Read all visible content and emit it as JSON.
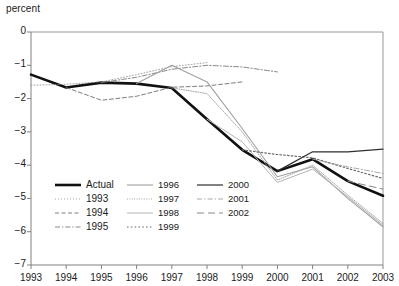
{
  "chart_data": {
    "type": "line",
    "title": "",
    "ylabel": "percent",
    "xlabel": "",
    "ylim": [
      -7,
      0
    ],
    "xlim": [
      1993,
      2003
    ],
    "grid": false,
    "legend_position": "inside-lower-left",
    "x": [
      1993,
      1994,
      1995,
      1996,
      1997,
      1998,
      1999,
      2000,
      2001,
      2002,
      2003
    ],
    "yticks": [
      "0",
      "−1",
      "−2",
      "−3",
      "−4",
      "−5",
      "−6",
      "−7"
    ],
    "ytick_values": [
      0,
      -1,
      -2,
      -3,
      -4,
      -5,
      -6,
      -7
    ],
    "xticks": [
      "1993",
      "1994",
      "1995",
      "1996",
      "1997",
      "1998",
      "1999",
      "2000",
      "2001",
      "2002",
      "2003"
    ],
    "series": [
      {
        "name": "Actual",
        "style": "solid",
        "width": 2.6,
        "color": "#111111",
        "x": [
          1993,
          1994,
          1995,
          1996,
          1997,
          1998,
          1999,
          2000,
          2001,
          2002,
          2003
        ],
        "values": [
          -1.28,
          -1.67,
          -1.52,
          -1.55,
          -1.68,
          -2.62,
          -3.54,
          -4.18,
          -3.82,
          -4.48,
          -4.92
        ]
      },
      {
        "name": "1993",
        "style": "fine-dotted",
        "width": 0.8,
        "color": "#8c8c8c",
        "x": [
          1993,
          1994,
          1995,
          1996,
          1997,
          1998
        ],
        "values": [
          -1.6,
          -1.57,
          -1.5,
          -1.28,
          -1.04,
          -0.92
        ]
      },
      {
        "name": "1994",
        "style": "dashed",
        "width": 0.9,
        "color": "#6e6e6e",
        "x": [
          1994,
          1995,
          1996,
          1997,
          1998,
          1999
        ],
        "values": [
          -1.67,
          -2.05,
          -1.93,
          -1.66,
          -1.62,
          -1.5
        ]
      },
      {
        "name": "1995",
        "style": "dash-dot",
        "width": 0.9,
        "color": "#7a7a7a",
        "x": [
          1995,
          1996,
          1997,
          1998,
          1999,
          2000
        ],
        "values": [
          -1.52,
          -1.36,
          -1.12,
          -1.0,
          -1.05,
          -1.2
        ]
      },
      {
        "name": "1996",
        "style": "solid-light",
        "width": 1.1,
        "color": "#a0a0a0",
        "x": [
          1996,
          1997,
          1998,
          1999,
          2000,
          2001,
          2002,
          2003
        ],
        "values": [
          -1.55,
          -1.0,
          -1.5,
          -2.9,
          -4.35,
          -4.05,
          -5.0,
          -5.85
        ]
      },
      {
        "name": "1997",
        "style": "dense-dotted",
        "width": 0.9,
        "color": "#9a9a9a",
        "x": [
          1997,
          1998,
          1999,
          2000,
          2001,
          2002,
          2003
        ],
        "values": [
          -1.68,
          -1.85,
          -3.0,
          -4.45,
          -4.0,
          -4.9,
          -5.75
        ]
      },
      {
        "name": "1998",
        "style": "solid-lighter",
        "width": 1.0,
        "color": "#b4b4b4",
        "x": [
          1998,
          1999,
          2000,
          2001,
          2002,
          2003
        ],
        "values": [
          -2.62,
          -3.3,
          -4.52,
          -4.12,
          -4.95,
          -5.8
        ]
      },
      {
        "name": "1999",
        "style": "dotted",
        "width": 1.2,
        "color": "#6a6a6a",
        "x": [
          1999,
          2000,
          2001,
          2002,
          2003
        ],
        "values": [
          -3.54,
          -3.68,
          -3.78,
          -4.1,
          -4.4
        ]
      },
      {
        "name": "2000",
        "style": "solid-dark",
        "width": 1.2,
        "color": "#2e2e2e",
        "x": [
          2000,
          2001,
          2002,
          2003
        ],
        "values": [
          -4.18,
          -3.6,
          -3.6,
          -3.52
        ]
      },
      {
        "name": "2001",
        "style": "dash-dot-light",
        "width": 0.9,
        "color": "#9e9e9e",
        "x": [
          2001,
          2002,
          2003
        ],
        "values": [
          -3.82,
          -4.05,
          -4.25
        ]
      },
      {
        "name": "2002",
        "style": "long-dash",
        "width": 1.0,
        "color": "#888888",
        "x": [
          2002,
          2003
        ],
        "values": [
          -4.48,
          -4.72
        ]
      }
    ],
    "legend_columns": [
      [
        "Actual",
        "1993",
        "1994",
        "1995"
      ],
      [
        "1996",
        "1997",
        "1998",
        "1999"
      ],
      [
        "2000",
        "2001",
        "2002"
      ]
    ]
  },
  "colors": {
    "axis": "#808080",
    "frame": "#999999",
    "text": "#1a1a1a",
    "background": "#ffffff"
  }
}
